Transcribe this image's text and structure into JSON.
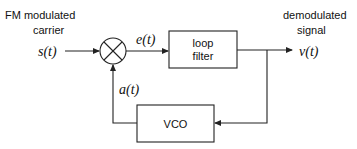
{
  "diagram": {
    "input": {
      "label_line1": "FM modulated",
      "label_line2": "carrier",
      "signal": "s(t)"
    },
    "multiplier": {
      "symbol": "×"
    },
    "error_signal": "e(t)",
    "loop_filter": {
      "line1": "loop",
      "line2": "filter"
    },
    "output": {
      "label_line1": "demodulated",
      "label_line2": "signal",
      "signal": "v(t)"
    },
    "vco": {
      "label": "VCO"
    },
    "feedback_signal": "a(t)",
    "colors": {
      "stroke": "#222222",
      "text": "#111111",
      "background": "#ffffff"
    }
  }
}
